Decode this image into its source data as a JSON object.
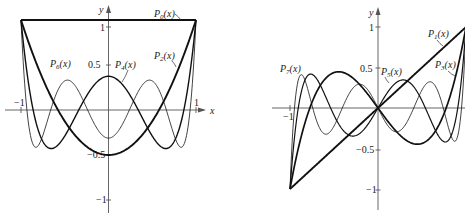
{
  "chart_data": [
    {
      "type": "line",
      "title": "",
      "xlabel": "x",
      "ylabel": "y",
      "xlim": [
        -1,
        1
      ],
      "ylim": [
        -1,
        1
      ],
      "grid": false,
      "x_ticks": [
        "-1",
        "1"
      ],
      "y_ticks": [
        "1",
        "0.5",
        "-0.5",
        "-1"
      ],
      "series": [
        {
          "name": "P_0(x)",
          "label_main": "P",
          "label_sub": "0",
          "label_arg": "(x)",
          "degree": 0,
          "weight": 2.0,
          "values_at": {
            "-1": 1,
            "0": 1,
            "1": 1
          }
        },
        {
          "name": "P_2(x)",
          "label_main": "P",
          "label_sub": "2",
          "label_arg": "(x)",
          "degree": 2,
          "weight": 1.9,
          "values_at": {
            "-1": 1,
            "0": -0.5,
            "1": 1
          }
        },
        {
          "name": "P_4(x)",
          "label_main": "P",
          "label_sub": "4",
          "label_arg": "(x)",
          "degree": 4,
          "weight": 1.4,
          "values_at": {
            "-1": 1,
            "0": 0.375,
            "1": 1
          }
        },
        {
          "name": "P_6(x)",
          "label_main": "P",
          "label_sub": "6",
          "label_arg": "(x)",
          "degree": 6,
          "weight": 0.8,
          "values_at": {
            "-1": 1,
            "0": -0.3125,
            "1": 1
          }
        }
      ]
    },
    {
      "type": "line",
      "title": "",
      "xlabel": "",
      "ylabel": "y",
      "xlim": [
        -1,
        1
      ],
      "ylim": [
        -1,
        1
      ],
      "grid": false,
      "x_ticks": [
        "-1"
      ],
      "y_ticks": [
        "1",
        "0.5",
        "-0.5",
        "-1"
      ],
      "series": [
        {
          "name": "P_1(x)",
          "label_main": "P",
          "label_sub": "1",
          "label_arg": "(x)",
          "degree": 1,
          "weight": 1.9,
          "values_at": {
            "-1": -1,
            "0": 0,
            "1": 1
          }
        },
        {
          "name": "P_3(x)",
          "label_main": "P",
          "label_sub": "3",
          "label_arg": "(x)",
          "degree": 3,
          "weight": 1.7,
          "values_at": {
            "-1": -1,
            "0": 0,
            "1": 1
          }
        },
        {
          "name": "P_5(x)",
          "label_main": "P",
          "label_sub": "5",
          "label_arg": "(x)",
          "degree": 5,
          "weight": 1.2,
          "values_at": {
            "-1": -1,
            "0": 0,
            "1": 1
          }
        },
        {
          "name": "P_7(x)",
          "label_main": "P",
          "label_sub": "7",
          "label_arg": "(x)",
          "degree": 7,
          "weight": 0.8,
          "values_at": {
            "-1": -1,
            "0": 0,
            "1": 1
          }
        }
      ]
    }
  ],
  "left": {
    "y_axis_label": "y",
    "x_axis_label": "x",
    "tick_1": "1",
    "tick_05": "0.5",
    "tick_m05": "−0.5",
    "tick_m1": "−1",
    "tick_xm1": "−1",
    "tick_x1": "1"
  },
  "right": {
    "y_axis_label": "y",
    "tick_1": "1",
    "tick_05": "0.5",
    "tick_m05": "−0.5",
    "tick_m1": "−1",
    "tick_xm1": "−1"
  }
}
